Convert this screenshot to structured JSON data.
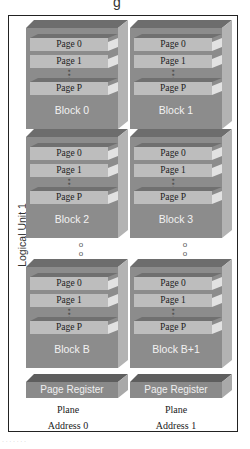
{
  "diagram": {
    "title_fragment": "g",
    "logical_unit_label": "Logical Unit 1",
    "colors": {
      "block_front": "#8c8c8c",
      "block_top": "#6d6d6d",
      "block_side": "#b3b3b3",
      "page_fill": "#bdbdbd",
      "frame": "#222222"
    },
    "planes": [
      {
        "plane_label": "Plane",
        "address_label": "Address 0",
        "page_register_label": "Page Register",
        "blocks": [
          {
            "label": "Block 0",
            "pages": [
              "Page 0",
              "Page 1",
              "Page P"
            ]
          },
          {
            "label": "Block 2",
            "pages": [
              "Page 0",
              "Page 1",
              "Page P"
            ]
          },
          {
            "label": "Block B",
            "pages": [
              "Page 0",
              "Page 1",
              "Page P"
            ]
          }
        ]
      },
      {
        "plane_label": "Plane",
        "address_label": "Address 1",
        "page_register_label": "Page Register",
        "blocks": [
          {
            "label": "Block 1",
            "pages": [
              "Page 0",
              "Page 1",
              "Page P"
            ]
          },
          {
            "label": "Block 3",
            "pages": [
              "Page 0",
              "Page 1",
              "Page P"
            ]
          },
          {
            "label": "Block B+1",
            "pages": [
              "Page 0",
              "Page 1",
              "Page P"
            ]
          }
        ]
      }
    ],
    "ellipsis_symbol": "o\no",
    "page_ellipsis_symbol": "●\n●\n●",
    "footnote": "· · · · · · ·"
  }
}
